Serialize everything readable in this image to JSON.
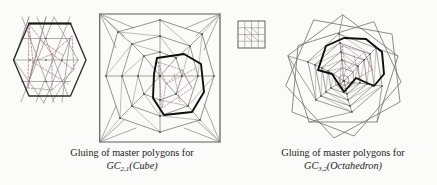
{
  "page": {
    "width": 437,
    "height": 185,
    "background": "#fbfbfa",
    "ink": "#2a2a2a"
  },
  "colors": {
    "line": "#555555",
    "line_light": "#8a8a8a",
    "bold": "#111111",
    "dashed": "#9c7f7f",
    "dashed_red": "#a06a6a",
    "vertex": "#222222"
  },
  "figures": {
    "left_hexagon": {
      "name": "master-hexagon-triangulated",
      "description": "hexagonal master polygon with triangular grid and dashed overlay"
    },
    "left_square": {
      "name": "gluing-square-cube",
      "description": "square master polygon triangulation with bold glued polygon overlay"
    },
    "small_grid": {
      "name": "small-grid-square",
      "description": "small 4 by 4 grid square with dashed diagonals"
    },
    "right_web": {
      "name": "gluing-web-octahedron",
      "description": "pentagonal spiral web with bold glued polygon overlay"
    }
  },
  "captions": {
    "left": {
      "line1": "Gluing of master polygons for",
      "symbol": "GC",
      "subscript": "2,1",
      "argument": "(Cube)"
    },
    "right": {
      "line1": "Gluing of master polygons for",
      "symbol": "GC",
      "subscript": "3,2",
      "argument": "(Octahedron)"
    }
  }
}
